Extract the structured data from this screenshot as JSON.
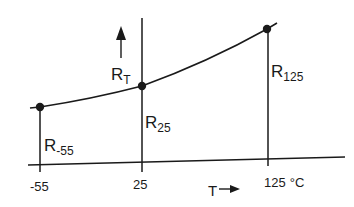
{
  "diagram": {
    "y_axis_label": "R",
    "y_axis_label_sub": "T",
    "x_axis_label": "T",
    "x_axis_arrow": "→",
    "points": [
      {
        "name": "R",
        "sub": "-55",
        "temperature": "-55"
      },
      {
        "name": "R",
        "sub": "25",
        "temperature": "25"
      },
      {
        "name": "R",
        "sub": "125",
        "temperature": "125"
      }
    ],
    "ticks": [
      "-55",
      "25",
      "125"
    ],
    "unit": "°C",
    "colors": {
      "line": "#1a1a1a",
      "background": "#ffffff"
    }
  }
}
